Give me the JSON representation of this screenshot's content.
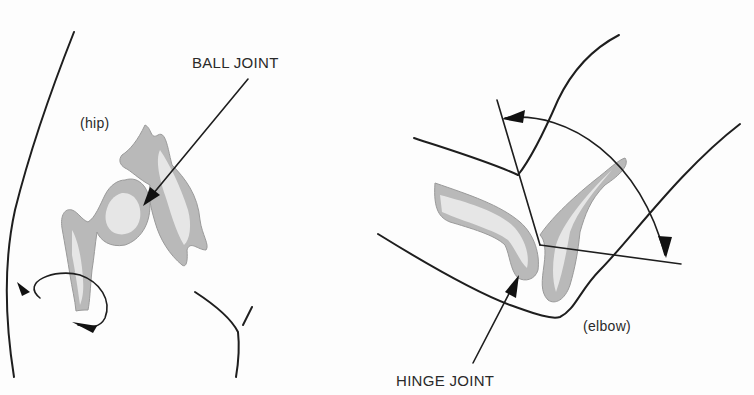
{
  "figure": {
    "left_panel": {
      "region_label": "(hip)",
      "joint_label": "BALL JOINT",
      "motion": "rotation"
    },
    "right_panel": {
      "region_label": "(elbow)",
      "joint_label": "HINGE JOINT",
      "motion": "flexion"
    }
  },
  "colors": {
    "ink": "#1e1e1e",
    "bone": "#b9b9b9",
    "background": "#fdfdfd"
  }
}
